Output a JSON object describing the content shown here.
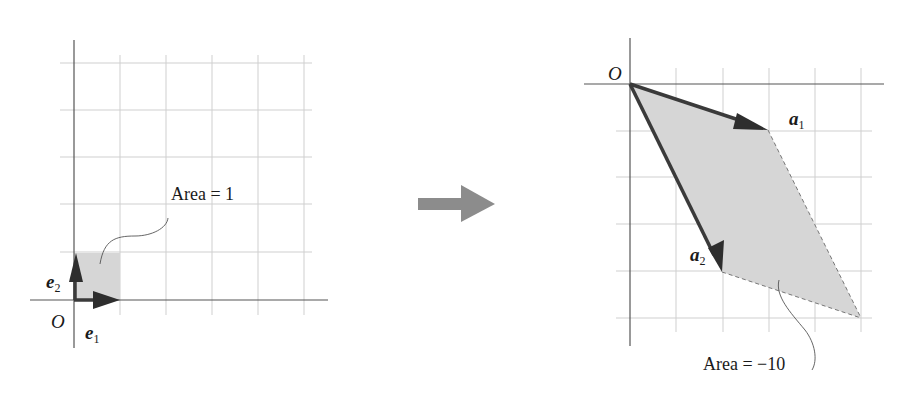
{
  "figure": {
    "colors": {
      "grid": "#c8c8c8",
      "axis": "#555555",
      "fill": "#d6d6d6",
      "vector": "#3a3a3a",
      "transform_arrow": "#8c8c8c",
      "text": "#1a1a1a"
    }
  },
  "left_panel": {
    "origin_label": "O",
    "vectors": [
      {
        "name": "e",
        "subscript": "1",
        "coords": [
          1,
          0
        ]
      },
      {
        "name": "e",
        "subscript": "2",
        "coords": [
          0,
          1
        ]
      }
    ],
    "area_label": "Area = 1"
  },
  "transform_arrow": {
    "icon": "right-arrow-icon"
  },
  "right_panel": {
    "origin_label": "O",
    "vectors": [
      {
        "name": "a",
        "subscript": "1",
        "coords": [
          3,
          -1
        ]
      },
      {
        "name": "a",
        "subscript": "2",
        "coords": [
          2,
          -4
        ]
      }
    ],
    "parallelogram_vertices": [
      [
        0,
        0
      ],
      [
        3,
        -1
      ],
      [
        5,
        -5
      ],
      [
        2,
        -4
      ]
    ],
    "area_label": "Area = −10"
  }
}
